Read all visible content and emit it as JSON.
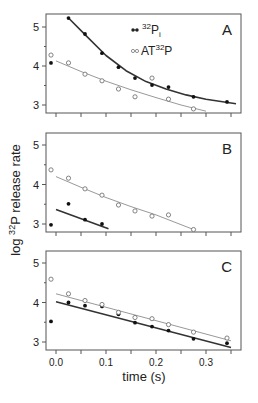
{
  "figure": {
    "ylabel_prefix": "log ",
    "ylabel_sup": "32",
    "ylabel_suffix": "P release rate",
    "xlabel": "time (s)",
    "x_tick_labels": [
      "0.0",
      "0.1",
      "0.2",
      "0.3"
    ],
    "legend": [
      {
        "marker": "filled",
        "label_pre": "",
        "sup": "32",
        "label_main": "P",
        "sub": "i"
      },
      {
        "marker": "open",
        "label_pre": "AT",
        "sup": "32",
        "label_main": "P",
        "sub": ""
      }
    ]
  },
  "chart_data": [
    {
      "type": "scatter",
      "panel": "A",
      "xlabel": "time (s)",
      "ylabel": "log 32P release rate",
      "xlim": [
        -0.02,
        0.36
      ],
      "ylim": [
        2.8,
        5.3
      ],
      "yticks": [
        3,
        4,
        5
      ],
      "xticks": [
        0.0,
        0.05,
        0.1,
        0.15,
        0.2,
        0.25,
        0.3,
        0.35
      ],
      "grid": false,
      "legend_position": "upper right",
      "series": [
        {
          "name": "32Pi",
          "marker": "filled",
          "x": [
            -0.01,
            0.025,
            0.058,
            0.092,
            0.125,
            0.158,
            0.192,
            0.225,
            0.275,
            0.342
          ],
          "y": [
            4.08,
            5.23,
            4.82,
            4.33,
            3.97,
            3.69,
            3.51,
            3.46,
            3.21,
            3.08
          ],
          "fit": {
            "x": [
              0.025,
              0.06,
              0.1,
              0.14,
              0.18,
              0.22,
              0.26,
              0.3,
              0.36
            ],
            "y": [
              5.23,
              4.78,
              4.27,
              3.88,
              3.6,
              3.41,
              3.26,
              3.15,
              3.03
            ]
          }
        },
        {
          "name": "AT32P",
          "marker": "open",
          "x": [
            -0.01,
            0.025,
            0.058,
            0.092,
            0.125,
            0.158,
            0.192,
            0.225,
            0.275
          ],
          "y": [
            4.28,
            4.08,
            3.79,
            3.62,
            3.41,
            3.21,
            3.69,
            3.15,
            2.9
          ],
          "fit": {
            "x": [
              0.0,
              0.05,
              0.1,
              0.15,
              0.2,
              0.25,
              0.3
            ],
            "y": [
              4.13,
              3.86,
              3.61,
              3.39,
              3.19,
              3.0,
              2.84
            ]
          }
        }
      ]
    },
    {
      "type": "scatter",
      "panel": "B",
      "xlim": [
        -0.02,
        0.36
      ],
      "ylim": [
        2.8,
        5.3
      ],
      "yticks": [
        3,
        4,
        5
      ],
      "series": [
        {
          "name": "32Pi",
          "marker": "filled",
          "x": [
            -0.01,
            0.025,
            0.058,
            0.092
          ],
          "y": [
            2.98,
            3.51,
            3.11,
            3.0
          ],
          "fit": {
            "x": [
              0.0,
              0.105
            ],
            "y": [
              3.37,
              2.88
            ]
          }
        },
        {
          "name": "AT32P",
          "marker": "open",
          "x": [
            -0.01,
            0.025,
            0.058,
            0.092,
            0.125,
            0.158,
            0.192,
            0.225,
            0.275
          ],
          "y": [
            4.37,
            4.16,
            3.89,
            3.73,
            3.48,
            3.33,
            3.2,
            3.23,
            2.86
          ],
          "fit": {
            "x": [
              0.0,
              0.05,
              0.1,
              0.15,
              0.2,
              0.275
            ],
            "y": [
              4.2,
              3.93,
              3.67,
              3.44,
              3.23,
              2.86
            ]
          }
        }
      ]
    },
    {
      "type": "scatter",
      "panel": "C",
      "xlim": [
        -0.02,
        0.36
      ],
      "ylim": [
        2.8,
        5.3
      ],
      "yticks": [
        3,
        4,
        5
      ],
      "series": [
        {
          "name": "32Pi",
          "marker": "filled",
          "x": [
            -0.01,
            0.025,
            0.058,
            0.092,
            0.125,
            0.158,
            0.192,
            0.225,
            0.275,
            0.342
          ],
          "y": [
            3.52,
            4.0,
            3.92,
            3.9,
            3.7,
            3.49,
            3.39,
            3.29,
            3.08,
            2.97
          ],
          "fit": {
            "x": [
              0.0,
              0.35
            ],
            "y": [
              4.02,
              2.86
            ]
          }
        },
        {
          "name": "AT32P",
          "marker": "open",
          "x": [
            -0.01,
            0.025,
            0.058,
            0.092,
            0.125,
            0.158,
            0.192,
            0.225,
            0.275,
            0.342
          ],
          "y": [
            4.59,
            4.22,
            4.05,
            3.95,
            3.75,
            3.62,
            3.59,
            3.44,
            3.25,
            3.1
          ],
          "fit": {
            "x": [
              0.0,
              0.35
            ],
            "y": [
              4.22,
              3.03
            ]
          }
        }
      ]
    }
  ],
  "panels_layout": [
    {
      "label": "A",
      "top": 14,
      "y5": 27,
      "y3": 105
    },
    {
      "label": "B",
      "top": 133,
      "y5": 145,
      "y3": 224
    },
    {
      "label": "C",
      "top": 251,
      "y5": 263,
      "y3": 342
    }
  ]
}
